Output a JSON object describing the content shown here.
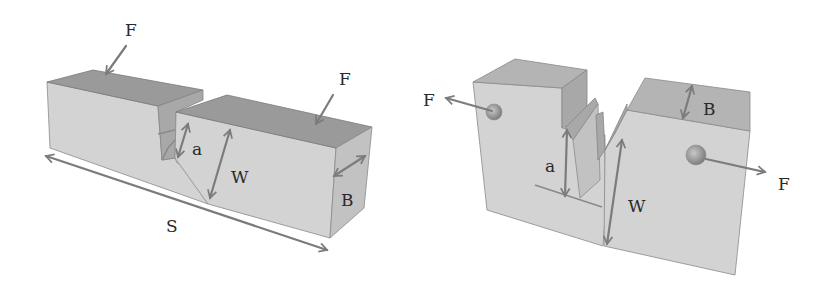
{
  "figure": {
    "left_specimen": {
      "type": "single-edge notched bend (three-point bending)",
      "labels": {
        "force_left": "F",
        "force_right": "F",
        "crack_length": "a",
        "width": "W",
        "thickness": "B",
        "span": "S"
      }
    },
    "right_specimen": {
      "type": "compact tension",
      "labels": {
        "force_left": "F",
        "force_right": "F",
        "crack_length": "a",
        "width": "W",
        "thickness": "B"
      }
    },
    "colors": {
      "front_face": "#d3d3d3",
      "top_face": "#9a9a9a",
      "side_face": "#c2c2c2",
      "arrow": "#7c7c7c",
      "text": "#2a2a2a"
    }
  }
}
